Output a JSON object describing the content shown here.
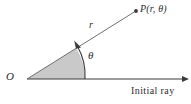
{
  "figure": {
    "background_color": "#ffffff",
    "stroke_color": "#3a3a3a",
    "sector_fill_color": "#c9c9c9",
    "labels": {
      "origin": "O",
      "radius": "r",
      "angle": "θ",
      "point": "P(r,  θ)",
      "initial_ray": "Initial  ray"
    },
    "geometry": {
      "origin_point": [
        27,
        79
      ],
      "point_p": [
        136,
        11
      ],
      "initial_ray_end": [
        186,
        79
      ],
      "arc_radius": 58,
      "ray_angle_degrees": 32,
      "sector_shaded": true
    },
    "icons": {
      "point_marker": "filled-dot-icon",
      "ray_arrowhead": "arrowhead-icon",
      "arc_arrowhead": "curved-arrow-icon"
    }
  }
}
